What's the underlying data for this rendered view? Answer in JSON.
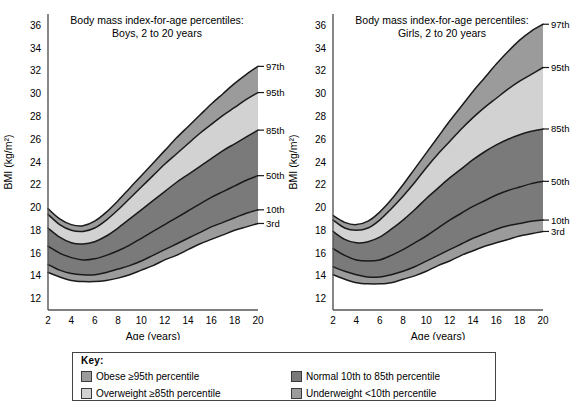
{
  "figure": {
    "axis_label_y": "BMI (kg/m²)",
    "axis_label_x": "Age (years)"
  },
  "legend": {
    "title": "Key:",
    "items": [
      {
        "label": "Obese ≥95th percentile",
        "color": "#9b9b9b",
        "name": "obese"
      },
      {
        "label": "Overweight ≥85th percentile",
        "color": "#d2d2d2",
        "name": "overweight"
      },
      {
        "label": "Normal 10th to 85th percentile",
        "color": "#7a7a7a",
        "name": "normal"
      },
      {
        "label": "Underweight <10th percentile",
        "color": "#9b9b9b",
        "name": "underweight"
      }
    ]
  },
  "chart_data": [
    {
      "type": "area",
      "name": "boys",
      "title": "Body mass index-for-age percentiles:",
      "subtitle": "Boys, 2 to 20 years",
      "xlabel": "Age (years)",
      "ylabel": "BMI (kg/m²)",
      "xlim": [
        2,
        20
      ],
      "ylim": [
        11,
        37
      ],
      "xticks": [
        2,
        4,
        6,
        8,
        10,
        12,
        14,
        16,
        18,
        20
      ],
      "yticks": [
        12,
        14,
        16,
        18,
        20,
        22,
        24,
        26,
        28,
        30,
        32,
        34,
        36
      ],
      "grid": false,
      "legend_position": "right-edge-labels",
      "x": [
        2,
        3,
        4,
        5,
        6,
        7,
        8,
        9,
        10,
        11,
        12,
        13,
        14,
        15,
        16,
        17,
        18,
        19,
        20
      ],
      "series": [
        {
          "name": "97th",
          "label": "97th",
          "values": [
            19.9,
            19.0,
            18.5,
            18.4,
            18.8,
            19.6,
            20.6,
            21.7,
            22.8,
            23.9,
            25.0,
            26.1,
            27.1,
            28.1,
            29.1,
            30.0,
            30.9,
            31.7,
            32.4
          ]
        },
        {
          "name": "95th",
          "label": "95th",
          "values": [
            19.4,
            18.5,
            18.0,
            17.9,
            18.2,
            18.9,
            19.8,
            20.8,
            21.8,
            22.8,
            23.8,
            24.7,
            25.6,
            26.5,
            27.3,
            28.1,
            28.8,
            29.5,
            30.1
          ]
        },
        {
          "name": "85th",
          "label": "85th",
          "values": [
            18.2,
            17.4,
            16.9,
            16.8,
            17.0,
            17.5,
            18.2,
            19.0,
            19.8,
            20.6,
            21.4,
            22.2,
            22.9,
            23.6,
            24.3,
            25.0,
            25.6,
            26.2,
            26.8
          ]
        },
        {
          "name": "50th",
          "label": "50th",
          "values": [
            16.6,
            16.0,
            15.6,
            15.4,
            15.5,
            15.8,
            16.2,
            16.7,
            17.3,
            17.9,
            18.5,
            19.1,
            19.7,
            20.3,
            20.9,
            21.4,
            21.9,
            22.4,
            22.8
          ]
        },
        {
          "name": "10th",
          "label": "10th",
          "values": [
            15.0,
            14.5,
            14.2,
            14.1,
            14.1,
            14.3,
            14.6,
            14.9,
            15.3,
            15.8,
            16.3,
            16.8,
            17.3,
            17.8,
            18.3,
            18.7,
            19.1,
            19.5,
            19.8
          ]
        },
        {
          "name": "3rd",
          "label": "3rd",
          "values": [
            14.3,
            13.9,
            13.6,
            13.5,
            13.5,
            13.6,
            13.8,
            14.1,
            14.5,
            14.9,
            15.4,
            15.8,
            16.3,
            16.8,
            17.2,
            17.6,
            18.0,
            18.3,
            18.6
          ]
        }
      ],
      "bands": [
        {
          "name": "obese-band",
          "upper": "97th",
          "lower": "95th",
          "color": "#9b9b9b"
        },
        {
          "name": "overweight-band",
          "upper": "95th",
          "lower": "85th",
          "color": "#d2d2d2"
        },
        {
          "name": "normal-band",
          "upper": "85th",
          "lower": "10th",
          "color": "#7a7a7a"
        },
        {
          "name": "underweight-band",
          "upper": "10th",
          "lower": "3rd",
          "color": "#9b9b9b"
        }
      ]
    },
    {
      "type": "area",
      "name": "girls",
      "title": "Body mass index-for-age percentiles:",
      "subtitle": "Girls, 2 to 20 years",
      "xlabel": "Age (years)",
      "ylabel": "BMI (kg/m²)",
      "xlim": [
        2,
        20
      ],
      "ylim": [
        11,
        37
      ],
      "xticks": [
        2,
        4,
        6,
        8,
        10,
        12,
        14,
        16,
        18,
        20
      ],
      "yticks": [
        12,
        14,
        16,
        18,
        20,
        22,
        24,
        26,
        28,
        30,
        32,
        34,
        36
      ],
      "grid": false,
      "legend_position": "right-edge-labels",
      "x": [
        2,
        3,
        4,
        5,
        6,
        7,
        8,
        9,
        10,
        11,
        12,
        13,
        14,
        15,
        16,
        17,
        18,
        19,
        20
      ],
      "series": [
        {
          "name": "97th",
          "label": "97th",
          "values": [
            19.3,
            18.7,
            18.5,
            18.8,
            19.6,
            20.7,
            22.0,
            23.4,
            24.8,
            26.2,
            27.6,
            28.9,
            30.2,
            31.4,
            32.6,
            33.7,
            34.7,
            35.5,
            36.1
          ]
        },
        {
          "name": "95th",
          "label": "95th",
          "values": [
            18.9,
            18.2,
            18.0,
            18.2,
            18.9,
            19.9,
            21.0,
            22.2,
            23.5,
            24.7,
            25.8,
            26.9,
            27.9,
            28.8,
            29.6,
            30.4,
            31.1,
            31.7,
            32.3
          ]
        },
        {
          "name": "85th",
          "label": "85th",
          "values": [
            17.9,
            17.2,
            16.9,
            17.0,
            17.4,
            18.1,
            18.9,
            19.8,
            20.8,
            21.7,
            22.6,
            23.4,
            24.2,
            24.9,
            25.5,
            26.0,
            26.4,
            26.7,
            26.9
          ]
        },
        {
          "name": "50th",
          "label": "50th",
          "values": [
            16.4,
            15.8,
            15.4,
            15.3,
            15.4,
            15.8,
            16.3,
            16.9,
            17.5,
            18.2,
            18.9,
            19.5,
            20.1,
            20.6,
            21.1,
            21.5,
            21.8,
            22.1,
            22.3
          ]
        },
        {
          "name": "10th",
          "label": "10th",
          "values": [
            14.8,
            14.4,
            14.1,
            13.9,
            13.9,
            14.1,
            14.4,
            14.8,
            15.3,
            15.8,
            16.3,
            16.8,
            17.3,
            17.7,
            18.1,
            18.4,
            18.6,
            18.8,
            18.9
          ]
        },
        {
          "name": "3rd",
          "label": "3rd",
          "values": [
            14.1,
            13.7,
            13.4,
            13.3,
            13.3,
            13.4,
            13.7,
            14.0,
            14.4,
            14.9,
            15.3,
            15.8,
            16.2,
            16.6,
            16.9,
            17.2,
            17.5,
            17.7,
            17.9
          ]
        }
      ],
      "bands": [
        {
          "name": "obese-band",
          "upper": "97th",
          "lower": "95th",
          "color": "#9b9b9b"
        },
        {
          "name": "overweight-band",
          "upper": "95th",
          "lower": "85th",
          "color": "#d2d2d2"
        },
        {
          "name": "normal-band",
          "upper": "85th",
          "lower": "10th",
          "color": "#7a7a7a"
        },
        {
          "name": "underweight-band",
          "upper": "10th",
          "lower": "3rd",
          "color": "#9b9b9b"
        }
      ]
    }
  ]
}
